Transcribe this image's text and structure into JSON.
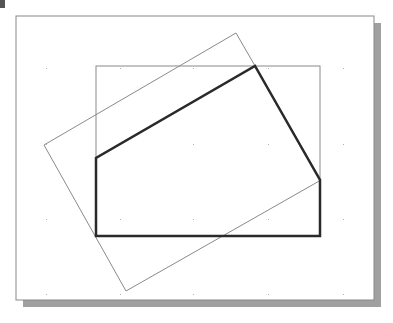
{
  "diagram": {
    "type": "geometry-sketch",
    "canvas": {
      "width": 393,
      "height": 323
    },
    "frame": {
      "x": 16,
      "y": 16,
      "width": 358,
      "height": 284,
      "stroke": "#888888",
      "shadow_color": "#9a9a9a",
      "shadow_offset": 7
    },
    "grid_dots": {
      "xs": [
        46,
        120,
        193,
        268,
        343
      ],
      "ys": [
        68,
        144,
        219,
        294
      ],
      "color": "#b0b0b0"
    },
    "shapes": [
      {
        "name": "reference-rectangle",
        "kind": "rect",
        "x": 96,
        "y": 66,
        "width": 224,
        "height": 170,
        "stroke": "#8a8a8a",
        "stroke_width": 1
      },
      {
        "name": "rotated-rectangle",
        "kind": "polygon",
        "points": "44,145 236,33 321,180 126,291",
        "stroke": "#8a8a8a",
        "stroke_width": 1
      },
      {
        "name": "profile-polygon",
        "kind": "polygon",
        "points": "96,236 96,158 255,66 320,180 320,236",
        "stroke": "#2a2a2a",
        "stroke_width": 2.5
      }
    ],
    "corner_mark_color": "#555555"
  }
}
